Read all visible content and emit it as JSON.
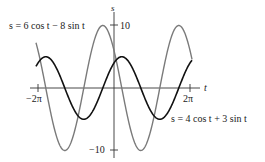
{
  "chart_data": {
    "type": "line",
    "title": "",
    "xlabel": "t",
    "ylabel": "s",
    "xlim": [
      -6.2832,
      6.2832
    ],
    "ylim": [
      -10,
      10
    ],
    "x_ticks": [
      {
        "value": -6.2832,
        "label": "−2π"
      },
      {
        "value": 6.2832,
        "label": "2π"
      }
    ],
    "y_ticks": [
      {
        "value": 10,
        "label": "10"
      },
      {
        "value": -10,
        "label": "−10"
      }
    ],
    "grid": false,
    "series": [
      {
        "name": "s = 6 cos t − 8 sin t",
        "formula": "6*cos(t) - 8*sin(t)",
        "amplitude": 10,
        "color": "#777777",
        "label_position": "upper-left"
      },
      {
        "name": "s = 4 cos t + 3 sin t",
        "formula": "4*cos(t) + 3*sin(t)",
        "amplitude": 5,
        "color": "#111111",
        "label_position": "lower-right"
      }
    ]
  },
  "labels": {
    "axis_s": "s",
    "axis_t": "t",
    "tick_pos10": "10",
    "tick_neg10": "−10",
    "tick_neg2pi": "−2π",
    "tick_pos2pi": "2π",
    "curve1_label": "s = 6 cos t − 8 sin t",
    "curve2_label": "s = 4 cos t + 3 sin t"
  }
}
